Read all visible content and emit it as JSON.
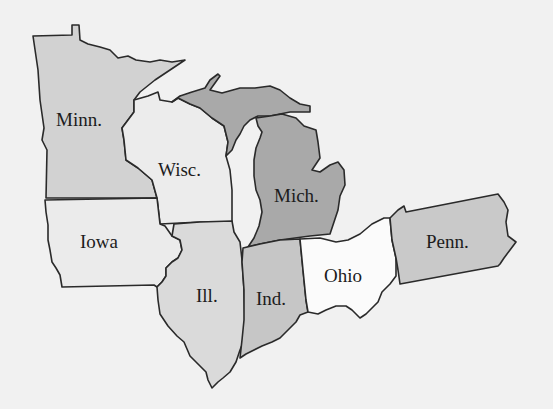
{
  "map": {
    "region": "Midwest / Great Lakes states",
    "background_color": "#f1f1f1",
    "states": [
      {
        "id": "minn",
        "label": "Minn.",
        "fill": "#d2d2d2"
      },
      {
        "id": "wisc",
        "label": "Wisc.",
        "fill": "#ececec"
      },
      {
        "id": "mich",
        "label": "Mich.",
        "fill": "#a9a9a9"
      },
      {
        "id": "iowa",
        "label": "Iowa",
        "fill": "#ebebeb"
      },
      {
        "id": "ill",
        "label": "Ill.",
        "fill": "#dadada"
      },
      {
        "id": "ind",
        "label": "Ind.",
        "fill": "#c6c6c6"
      },
      {
        "id": "ohio",
        "label": "Ohio",
        "fill": "#fbfbfb"
      },
      {
        "id": "penn",
        "label": "Penn.",
        "fill": "#c9c9c9"
      }
    ]
  }
}
